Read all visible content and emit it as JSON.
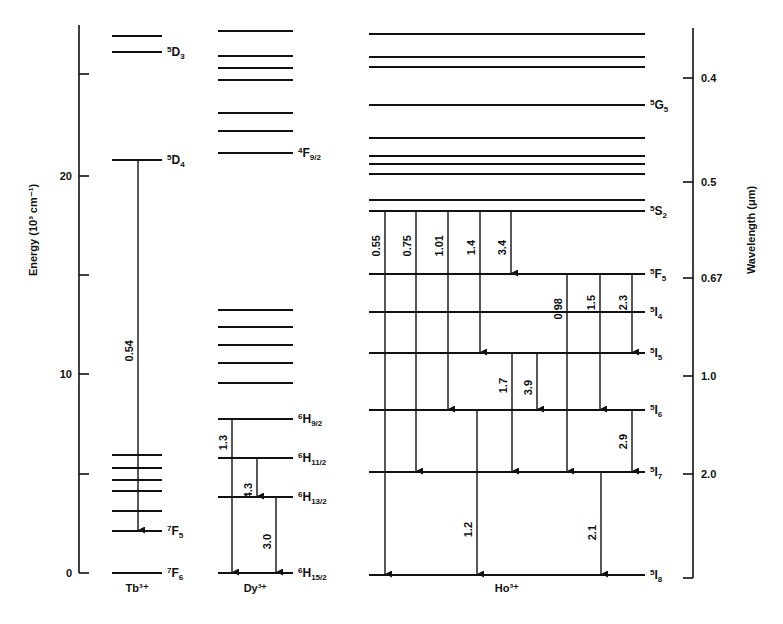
{
  "diagram": {
    "left_axis": {
      "label": "Energy (10³ cm⁻¹)",
      "ticks": [
        {
          "value": 0,
          "label": "0",
          "y": 573
        },
        {
          "value": 5,
          "label": "",
          "y": 474
        },
        {
          "value": 10,
          "label": "10",
          "y": 374
        },
        {
          "value": 15,
          "label": "",
          "y": 275
        },
        {
          "value": 20,
          "label": "20",
          "y": 176
        },
        {
          "value": 25,
          "label": "",
          "y": 74
        }
      ]
    },
    "right_axis": {
      "label": "Wavelength (μm)",
      "ticks": [
        {
          "label": "0.4",
          "y": 78
        },
        {
          "label": "0.5",
          "y": 182
        },
        {
          "label": "0.67",
          "y": 278
        },
        {
          "label": "1.0",
          "y": 376
        },
        {
          "label": "2.0",
          "y": 474
        },
        {
          "label": "",
          "y": 578
        }
      ]
    },
    "ions": [
      {
        "name": "Tb³⁺",
        "x1": 112,
        "x2": 162,
        "levels": [
          {
            "y": 36,
            "term": "",
            "sup": "",
            "letter": "",
            "sub": ""
          },
          {
            "y": 52,
            "term": "5D3",
            "sup": "5",
            "letter": "D",
            "sub": "3"
          },
          {
            "y": 160,
            "term": "5D4",
            "sup": "5",
            "letter": "D",
            "sub": "4"
          },
          {
            "y": 455,
            "term": "",
            "sup": "",
            "letter": "",
            "sub": ""
          },
          {
            "y": 468,
            "term": "",
            "sup": "",
            "letter": "",
            "sub": ""
          },
          {
            "y": 480,
            "term": "",
            "sup": "",
            "letter": "",
            "sub": ""
          },
          {
            "y": 491,
            "term": "",
            "sup": "",
            "letter": "",
            "sub": ""
          },
          {
            "y": 511,
            "term": "",
            "sup": "",
            "letter": "",
            "sub": ""
          },
          {
            "y": 531,
            "term": "7F5",
            "sup": "7",
            "letter": "F",
            "sub": "5"
          },
          {
            "y": 573,
            "term": "7F6",
            "sup": "7",
            "letter": "F",
            "sub": "6"
          }
        ],
        "transitions": [
          {
            "x": 138,
            "y1": 160,
            "y2": 531,
            "label": "0.54",
            "label_y": 340
          }
        ]
      },
      {
        "name": "Dy³⁺",
        "x1": 218,
        "x2": 293,
        "levels": [
          {
            "y": 31,
            "term": "",
            "sup": "",
            "letter": "",
            "sub": ""
          },
          {
            "y": 56,
            "term": "",
            "sup": "",
            "letter": "",
            "sub": ""
          },
          {
            "y": 68,
            "term": "",
            "sup": "",
            "letter": "",
            "sub": ""
          },
          {
            "y": 80,
            "term": "",
            "sup": "",
            "letter": "",
            "sub": ""
          },
          {
            "y": 113,
            "term": "",
            "sup": "",
            "letter": "",
            "sub": ""
          },
          {
            "y": 131,
            "term": "",
            "sup": "",
            "letter": "",
            "sub": ""
          },
          {
            "y": 153,
            "term": "4F9/2",
            "sup": "4",
            "letter": "F",
            "sub": "9/2"
          },
          {
            "y": 310,
            "term": "",
            "sup": "",
            "letter": "",
            "sub": ""
          },
          {
            "y": 327,
            "term": "",
            "sup": "",
            "letter": "",
            "sub": ""
          },
          {
            "y": 345,
            "term": "",
            "sup": "",
            "letter": "",
            "sub": ""
          },
          {
            "y": 363,
            "term": "",
            "sup": "",
            "letter": "",
            "sub": ""
          },
          {
            "y": 383,
            "term": "",
            "sup": "",
            "letter": "",
            "sub": ""
          },
          {
            "y": 419,
            "term": "6H9/2",
            "sup": "6",
            "letter": "H",
            "sub": "9/2"
          },
          {
            "y": 458,
            "term": "6H11/2",
            "sup": "6",
            "letter": "H",
            "sub": "11/2"
          },
          {
            "y": 497,
            "term": "6H13/2",
            "sup": "6",
            "letter": "H",
            "sub": "13/2"
          },
          {
            "y": 573,
            "term": "6H15/2",
            "sup": "6",
            "letter": "H",
            "sub": "15/2"
          }
        ],
        "transitions": [
          {
            "x": 232,
            "y1": 419,
            "y2": 573,
            "label": "1.3",
            "label_y": 435
          },
          {
            "x": 257,
            "y1": 458,
            "y2": 497,
            "label": "4.3",
            "label_y": 483
          },
          {
            "x": 276,
            "y1": 497,
            "y2": 573,
            "label": "3.0",
            "label_y": 534
          }
        ]
      },
      {
        "name": "Ho³⁺",
        "x1": 369,
        "x2": 645,
        "levels": [
          {
            "y": 34,
            "term": "",
            "sup": "",
            "letter": "",
            "sub": ""
          },
          {
            "y": 57,
            "term": "",
            "sup": "",
            "letter": "",
            "sub": ""
          },
          {
            "y": 67,
            "term": "",
            "sup": "",
            "letter": "",
            "sub": ""
          },
          {
            "y": 105,
            "term": "5G5",
            "sup": "5",
            "letter": "G",
            "sub": "5"
          },
          {
            "y": 138,
            "term": "",
            "sup": "",
            "letter": "",
            "sub": ""
          },
          {
            "y": 156,
            "term": "",
            "sup": "",
            "letter": "",
            "sub": ""
          },
          {
            "y": 164,
            "term": "",
            "sup": "",
            "letter": "",
            "sub": ""
          },
          {
            "y": 174,
            "term": "",
            "sup": "",
            "letter": "",
            "sub": ""
          },
          {
            "y": 200,
            "term": "",
            "sup": "",
            "letter": "",
            "sub": ""
          },
          {
            "y": 211,
            "term": "5S2",
            "sup": "5",
            "letter": "S",
            "sub": "2"
          },
          {
            "y": 274,
            "term": "5F5",
            "sup": "5",
            "letter": "F",
            "sub": "5"
          },
          {
            "y": 312,
            "term": "5I4",
            "sup": "5",
            "letter": "I",
            "sub": "4"
          },
          {
            "y": 353,
            "term": "5I5",
            "sup": "5",
            "letter": "I",
            "sub": "5"
          },
          {
            "y": 410,
            "term": "5I6",
            "sup": "5",
            "letter": "I",
            "sub": "6"
          },
          {
            "y": 472,
            "term": "5I7",
            "sup": "5",
            "letter": "I",
            "sub": "7"
          },
          {
            "y": 575,
            "term": "5I8",
            "sup": "5",
            "letter": "I",
            "sub": "8"
          }
        ],
        "transitions": [
          {
            "x": 385,
            "y1": 211,
            "y2": 575,
            "label": "0.55",
            "label_y": 235
          },
          {
            "x": 416,
            "y1": 211,
            "y2": 472,
            "label": "0.75",
            "label_y": 235
          },
          {
            "x": 448,
            "y1": 211,
            "y2": 410,
            "label": "1.01",
            "label_y": 235
          },
          {
            "x": 480,
            "y1": 211,
            "y2": 353,
            "label": "1.4",
            "label_y": 240
          },
          {
            "x": 511,
            "y1": 211,
            "y2": 274,
            "label": "3.4",
            "label_y": 240
          },
          {
            "x": 567,
            "y1": 274,
            "y2": 472,
            "label": "0.98",
            "label_y": 298
          },
          {
            "x": 600,
            "y1": 274,
            "y2": 410,
            "label": "1.5",
            "label_y": 295
          },
          {
            "x": 632,
            "y1": 274,
            "y2": 353,
            "label": "2.3",
            "label_y": 295
          },
          {
            "x": 512,
            "y1": 353,
            "y2": 472,
            "label": "1.7",
            "label_y": 378
          },
          {
            "x": 537,
            "y1": 353,
            "y2": 410,
            "label": "3.9",
            "label_y": 380
          },
          {
            "x": 632,
            "y1": 410,
            "y2": 472,
            "label": "2.9",
            "label_y": 434
          },
          {
            "x": 477,
            "y1": 410,
            "y2": 575,
            "label": "1.2",
            "label_y": 522
          },
          {
            "x": 601,
            "y1": 472,
            "y2": 575,
            "label": "2.1",
            "label_y": 525
          }
        ]
      }
    ]
  }
}
